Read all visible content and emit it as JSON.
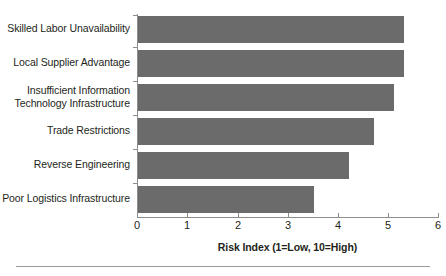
{
  "chart_data": {
    "type": "bar",
    "orientation": "horizontal",
    "title": "",
    "xlabel": "Risk Index (1=Low, 10=High)",
    "ylabel": "",
    "xlim": [
      0,
      6
    ],
    "xticks": [
      0,
      1,
      2,
      3,
      4,
      5,
      6
    ],
    "xtick_labels": [
      "0",
      "1",
      "2",
      "3",
      "4",
      "5",
      "6"
    ],
    "grid": false,
    "legend": null,
    "bar_color": "#6b6b6b",
    "categories": [
      "Skilled Labor Unavailability",
      "Local Supplier Advantage",
      "Insufficient Information\nTechnology Infrastructure",
      "Trade Restrictions",
      "Reverse Engineering",
      "Poor Logistics Infrastructure"
    ],
    "values": [
      5.3,
      5.3,
      5.1,
      4.7,
      4.2,
      3.5
    ]
  },
  "axis": {
    "title": "Risk Index (1=Low, 10=High)"
  }
}
